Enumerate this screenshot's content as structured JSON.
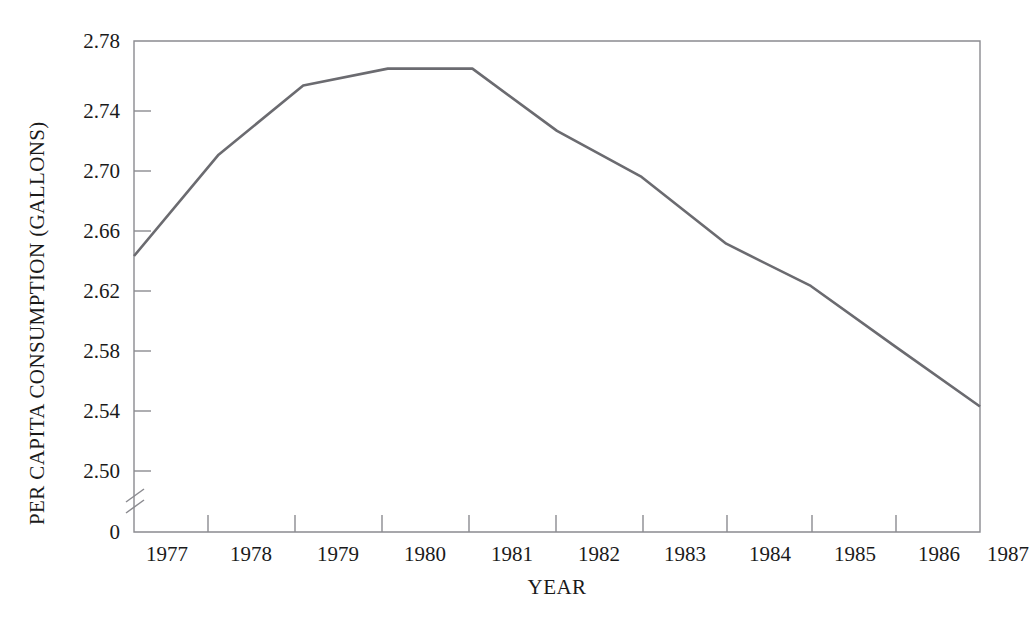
{
  "chart_data": {
    "type": "line",
    "title": "",
    "xlabel": "YEAR",
    "ylabel": "PER CAPITA CONSUMPTION (GALLONS)",
    "x": [
      1977,
      1978,
      1979,
      1980,
      1981,
      1982,
      1983,
      1984,
      1985,
      1986,
      1987
    ],
    "values": [
      2.64,
      2.706,
      2.751,
      2.762,
      2.762,
      2.7215,
      2.6915,
      2.648,
      2.6205,
      2.581,
      2.542
    ],
    "series": [
      {
        "name": "Per capita consumption",
        "values": [
          2.64,
          2.706,
          2.751,
          2.762,
          2.762,
          2.7215,
          2.6915,
          2.648,
          2.6205,
          2.581,
          2.542
        ]
      }
    ],
    "categories": [
      "1977",
      "1978",
      "1979",
      "1980",
      "1981",
      "1982",
      "1983",
      "1984",
      "1985",
      "1986",
      "1987"
    ],
    "ylim": [
      2.48,
      2.78
    ],
    "y_ticks": [
      2.5,
      2.54,
      2.58,
      2.62,
      2.66,
      2.7,
      2.74,
      2.78
    ],
    "y_tick_labels": [
      "2.50",
      "2.54",
      "2.58",
      "2.62",
      "2.66",
      "2.70",
      "2.74",
      "2.78"
    ],
    "y_origin_label": "0",
    "y_axis_break": true,
    "x_ticks": [
      1977,
      1978,
      1979,
      1980,
      1981,
      1982,
      1983,
      1984,
      1985,
      1986,
      1987
    ],
    "x_tick_labels": [
      "1977",
      "1978",
      "1979",
      "1980",
      "1981",
      "1982",
      "1983",
      "1984",
      "1985",
      "1986",
      "1987"
    ],
    "grid": false,
    "legend": null,
    "line_color": "#6b6b70",
    "axis_color": "#8b8b90",
    "background": "#ffffff"
  },
  "axes": {
    "y_title": "PER CAPITA CONSUMPTION (GALLONS)",
    "x_title": "YEAR",
    "origin_label": "0"
  },
  "y_labels": {
    "t0": "2.78",
    "t1": "2.74",
    "t2": "2.70",
    "t3": "2.66",
    "t4": "2.62",
    "t5": "2.58",
    "t6": "2.54",
    "t7": "2.50"
  },
  "x_labels": {
    "l0": "1977",
    "l1": "1978",
    "l2": "1979",
    "l3": "1980",
    "l4": "1981",
    "l5": "1982",
    "l6": "1983",
    "l7": "1984",
    "l8": "1985",
    "l9": "1986",
    "l10": "1987"
  }
}
